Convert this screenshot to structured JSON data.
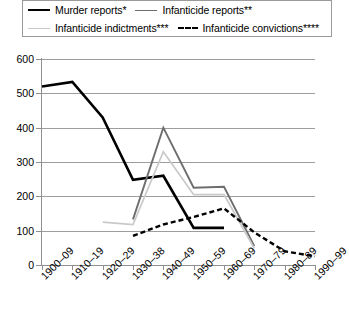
{
  "legend": {
    "entries": [
      {
        "label": "Murder reports*",
        "swatch": "solid-thick-black-line-icon",
        "color": "#000000"
      },
      {
        "label": "Infanticide reports**",
        "swatch": "solid-gray-line-icon",
        "color": "#6e6e6e"
      },
      {
        "label": "Infanticide indictments***",
        "swatch": "solid-light-gray-line-icon",
        "color": "#c9c9c9"
      },
      {
        "label": "Infanticide convictions****",
        "swatch": "dashed-black-line-icon",
        "color": "#000000"
      }
    ]
  },
  "axes": {
    "y_ticks": [
      "600",
      "500",
      "400",
      "300",
      "200",
      "100",
      "0"
    ],
    "x_ticks": [
      "1900–09",
      "1910–19",
      "1920–29",
      "1930–38",
      "1940–49",
      "1950–59",
      "1960–69",
      "1970–79",
      "1980–89",
      "1990–99"
    ]
  },
  "chart_data": {
    "type": "line",
    "title": "",
    "xlabel": "",
    "ylabel": "",
    "ylim": [
      0,
      600
    ],
    "ytick_step": 100,
    "grid": true,
    "legend_position": "top",
    "categories": [
      "1900–09",
      "1910–19",
      "1920–29",
      "1930–38",
      "1940–49",
      "1950–59",
      "1960–69",
      "1970–79",
      "1980–89",
      "1990–99"
    ],
    "series": [
      {
        "name": "Murder reports*",
        "color": "#000000",
        "style": "solid",
        "width": 2.6,
        "values": [
          520,
          533,
          430,
          248,
          260,
          108,
          108,
          null,
          null,
          null
        ]
      },
      {
        "name": "Infanticide reports**",
        "color": "#6e6e6e",
        "style": "solid",
        "width": 1.9,
        "values": [
          null,
          null,
          null,
          133,
          400,
          225,
          228,
          55,
          null,
          null
        ]
      },
      {
        "name": "Infanticide indictments***",
        "color": "#c9c9c9",
        "style": "solid",
        "width": 1.7,
        "values": [
          null,
          null,
          125,
          118,
          330,
          205,
          205,
          48,
          null,
          null
        ]
      },
      {
        "name": "Infanticide convictions****",
        "color": "#000000",
        "style": "dashed",
        "width": 2.4,
        "values": [
          null,
          null,
          null,
          85,
          118,
          140,
          165,
          95,
          40,
          25
        ]
      }
    ]
  }
}
